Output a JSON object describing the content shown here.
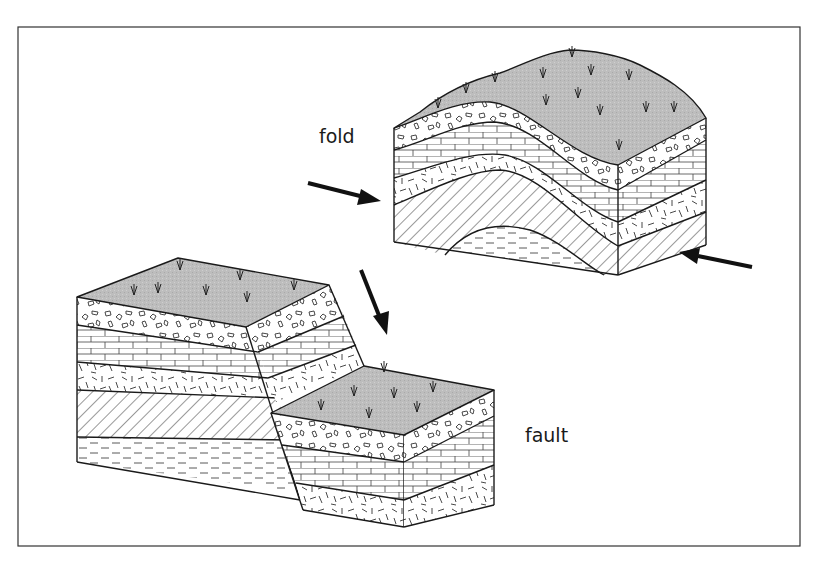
{
  "diagram": {
    "labels": {
      "fold": "fold",
      "fault": "fault"
    },
    "colors": {
      "frame": "#333333",
      "line": "#1a1a1a",
      "surface": "#bdbdbd",
      "background": "#ffffff"
    },
    "layers_top_to_bottom": [
      "soil-surface-with-grass",
      "conglomerate",
      "limestone",
      "igneous-speckled",
      "sandstone-hatched",
      "shale-dashed"
    ],
    "arrows": [
      {
        "name": "compression-arrow-left",
        "direction": "right"
      },
      {
        "name": "compression-arrow-right",
        "direction": "left"
      },
      {
        "name": "fault-displacement-arrow",
        "direction": "down"
      }
    ]
  }
}
